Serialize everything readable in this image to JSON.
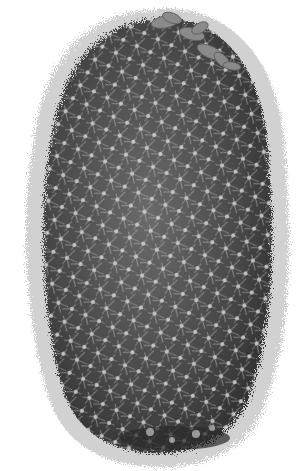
{
  "image": {
    "subject": "cactus",
    "description": "Grayscale illustration of a tall cylindrical spiny cactus with a few flowers at the top right",
    "colors": {
      "background": "#ffffff",
      "body_dark": "#3a3a3a",
      "body_mid": "#5e5e5e",
      "spine": "#d8d8d8",
      "flower": "#8a8a8a"
    }
  }
}
